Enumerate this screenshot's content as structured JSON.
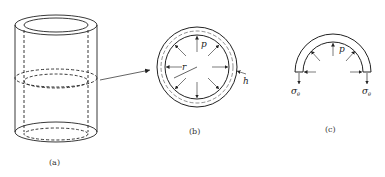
{
  "figure": {
    "panels": [
      {
        "id": "a",
        "caption": "(a)",
        "description": "thin-walled cylinder with dashed section cut"
      },
      {
        "id": "b",
        "caption": "(b)",
        "description": "cross-section ring under internal pressure"
      },
      {
        "id": "c",
        "caption": "(c)",
        "description": "half-ring free body with hoop stresses"
      }
    ],
    "symbols": {
      "pressure": "p",
      "radius": "r",
      "thickness": "h",
      "hoop_stress": "σ",
      "hoop_stress_subscript": "θ"
    },
    "colors": {
      "stroke": "#222222",
      "background": "#ffffff"
    }
  }
}
